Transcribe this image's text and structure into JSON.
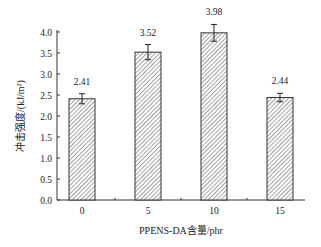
{
  "chart_data": {
    "type": "bar",
    "title": "",
    "xlabel": "PPENS-DA含量/phr",
    "ylabel": "冲击强度/(kJ/m²)",
    "categories": [
      "0",
      "5",
      "10",
      "15"
    ],
    "values": [
      2.41,
      3.52,
      3.98,
      2.44
    ],
    "error": [
      0.12,
      0.18,
      0.2,
      0.1
    ],
    "data_labels": [
      "2.41",
      "3.52",
      "3.98",
      "2.44"
    ],
    "ylim": [
      0,
      4.0
    ],
    "yticks": [
      "0.0",
      "0.5",
      "1.0",
      "1.5",
      "2.0",
      "2.5",
      "3.0",
      "3.5",
      "4.0"
    ],
    "grid": false,
    "legend": null,
    "bar_fill": "hatched",
    "colors": {
      "axis": "#333333",
      "bar_edge": "#333333",
      "hatch": "#666666"
    }
  }
}
